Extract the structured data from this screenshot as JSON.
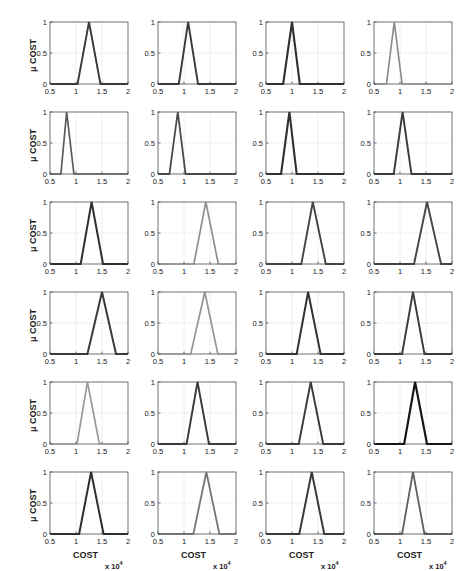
{
  "figure": {
    "kind": "subplot-grid",
    "rows": 6,
    "cols": 4,
    "background": "#ffffff",
    "axis_color": "#4d4d4d",
    "grid_color": "#c8c8c8",
    "tick_label_color": "#1a1a1a",
    "ylabel": "μ COST",
    "xlabel": "COST",
    "x_exponent_prefix": "x 10",
    "x_exponent_power": "4",
    "x_ticks": [
      "0.5",
      "1",
      "1.5",
      "2"
    ],
    "x_tick_values": [
      0.5,
      1,
      1.5,
      2
    ],
    "y_ticks": [
      "0",
      "0.5",
      "1"
    ],
    "y_tick_values": [
      0,
      0.5,
      1
    ],
    "xlim": [
      0.5,
      2
    ],
    "ylim": [
      0,
      1
    ]
  },
  "chart_data": {
    "type": "line",
    "title": "",
    "xlabel": "COST  x 10^4",
    "ylabel": "μ COST",
    "xlim": [
      0.5,
      2
    ],
    "ylim": [
      0,
      1
    ],
    "grid": true,
    "x_ticks": [
      0.5,
      1,
      1.5,
      2
    ],
    "y_ticks": [
      0,
      0.5,
      1
    ],
    "layout": {
      "rows": 6,
      "cols": 4,
      "shared_axes": true
    },
    "note": "Each subplot is a triangular fuzzy membership function of COST (x10^4). Series given as left-base, peak (mu=1), right-base.",
    "panels": [
      {
        "index": 1,
        "row": 1,
        "col": 1,
        "left": 1.03,
        "peak": 1.25,
        "right": 1.47,
        "color": "#3a3a3a",
        "width": 1.9
      },
      {
        "index": 2,
        "row": 1,
        "col": 2,
        "left": 0.9,
        "peak": 1.08,
        "right": 1.27,
        "color": "#3a3a3a",
        "width": 1.9
      },
      {
        "index": 3,
        "row": 1,
        "col": 3,
        "left": 0.83,
        "peak": 1.0,
        "right": 1.15,
        "color": "#303030",
        "width": 2.1
      },
      {
        "index": 4,
        "row": 1,
        "col": 4,
        "left": 0.74,
        "peak": 0.89,
        "right": 1.04,
        "color": "#8c8c8c",
        "width": 1.7
      },
      {
        "index": 5,
        "row": 2,
        "col": 1,
        "left": 0.71,
        "peak": 0.82,
        "right": 0.96,
        "color": "#5a5a5a",
        "width": 1.7
      },
      {
        "index": 6,
        "row": 2,
        "col": 2,
        "left": 0.72,
        "peak": 0.88,
        "right": 1.03,
        "color": "#4a4a4a",
        "width": 1.8
      },
      {
        "index": 7,
        "row": 2,
        "col": 3,
        "left": 0.79,
        "peak": 0.95,
        "right": 1.09,
        "color": "#303030",
        "width": 2.1
      },
      {
        "index": 8,
        "row": 2,
        "col": 4,
        "left": 0.88,
        "peak": 1.05,
        "right": 1.22,
        "color": "#3a3a3a",
        "width": 1.9
      },
      {
        "index": 9,
        "row": 3,
        "col": 1,
        "left": 1.09,
        "peak": 1.3,
        "right": 1.52,
        "color": "#303030",
        "width": 2.0
      },
      {
        "index": 10,
        "row": 3,
        "col": 2,
        "left": 1.19,
        "peak": 1.42,
        "right": 1.66,
        "color": "#8f8f8f",
        "width": 1.7
      },
      {
        "index": 11,
        "row": 3,
        "col": 3,
        "left": 1.18,
        "peak": 1.4,
        "right": 1.65,
        "color": "#444444",
        "width": 1.9
      },
      {
        "index": 12,
        "row": 3,
        "col": 4,
        "left": 1.27,
        "peak": 1.52,
        "right": 1.79,
        "color": "#444444",
        "width": 1.9
      },
      {
        "index": 13,
        "row": 4,
        "col": 1,
        "left": 1.22,
        "peak": 1.5,
        "right": 1.77,
        "color": "#3a3a3a",
        "width": 2.0
      },
      {
        "index": 14,
        "row": 4,
        "col": 2,
        "left": 1.13,
        "peak": 1.4,
        "right": 1.65,
        "color": "#959595",
        "width": 1.7
      },
      {
        "index": 15,
        "row": 4,
        "col": 3,
        "left": 1.09,
        "peak": 1.31,
        "right": 1.55,
        "color": "#333333",
        "width": 2.0
      },
      {
        "index": 16,
        "row": 4,
        "col": 4,
        "left": 1.04,
        "peak": 1.25,
        "right": 1.47,
        "color": "#3a3a3a",
        "width": 1.9
      },
      {
        "index": 17,
        "row": 5,
        "col": 1,
        "left": 1.02,
        "peak": 1.22,
        "right": 1.45,
        "color": "#9a9a9a",
        "width": 1.7
      },
      {
        "index": 18,
        "row": 5,
        "col": 2,
        "left": 1.05,
        "peak": 1.26,
        "right": 1.48,
        "color": "#3a3a3a",
        "width": 1.9
      },
      {
        "index": 19,
        "row": 5,
        "col": 3,
        "left": 1.13,
        "peak": 1.36,
        "right": 1.6,
        "color": "#3a3a3a",
        "width": 1.9
      },
      {
        "index": 20,
        "row": 5,
        "col": 4,
        "left": 1.08,
        "peak": 1.29,
        "right": 1.52,
        "color": "#161616",
        "width": 2.2
      },
      {
        "index": 21,
        "row": 6,
        "col": 1,
        "left": 1.06,
        "peak": 1.29,
        "right": 1.53,
        "color": "#2e2e2e",
        "width": 2.0
      },
      {
        "index": 22,
        "row": 6,
        "col": 2,
        "left": 1.18,
        "peak": 1.43,
        "right": 1.68,
        "color": "#757575",
        "width": 1.8
      },
      {
        "index": 23,
        "row": 6,
        "col": 3,
        "left": 1.14,
        "peak": 1.38,
        "right": 1.62,
        "color": "#3a3a3a",
        "width": 2.0
      },
      {
        "index": 24,
        "row": 6,
        "col": 4,
        "left": 1.04,
        "peak": 1.25,
        "right": 1.47,
        "color": "#5f5f5f",
        "width": 1.8
      }
    ]
  }
}
